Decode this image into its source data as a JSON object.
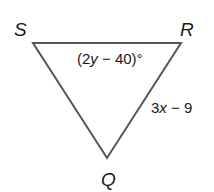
{
  "diagram": {
    "type": "triangle",
    "vertices": {
      "S": {
        "label": "S",
        "x": 33,
        "y": 43
      },
      "R": {
        "label": "R",
        "x": 181,
        "y": 43
      },
      "Q": {
        "label": "Q",
        "x": 107,
        "y": 158
      }
    },
    "angle_R": {
      "prefix": "(2",
      "var": "y",
      "suffix": " − 40)°"
    },
    "side_RQ": {
      "coef": "3",
      "var": "x",
      "suffix": " − 9"
    },
    "stroke_color": "#555555"
  }
}
